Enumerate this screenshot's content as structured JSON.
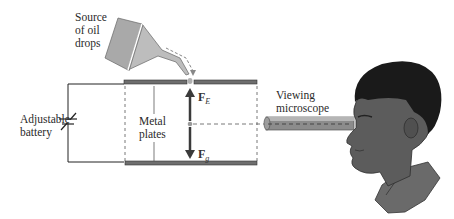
{
  "diagram": {
    "labels": {
      "source": [
        "Source",
        "of oil",
        "drops"
      ],
      "battery": [
        "Adjustable",
        "battery"
      ],
      "plates": [
        "Metal",
        "plates"
      ],
      "microscope": [
        "Viewing",
        "microscope"
      ]
    },
    "forces": {
      "electric": {
        "symbol": "F",
        "subscript": "E",
        "direction": "up"
      },
      "gravity": {
        "symbol": "F",
        "subscript": "g",
        "direction": "down"
      }
    },
    "colors": {
      "plate": "#6e6e6e",
      "funnel": "#a9a9a9",
      "microscope": "#8c8c8c",
      "skin": "#5c5c5c",
      "hair": "#1a1a1a",
      "arrow": "#3a3a3a",
      "wire": "#222222"
    }
  }
}
